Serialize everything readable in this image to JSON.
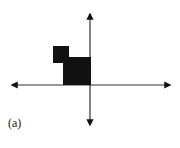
{
  "figure": {
    "label": "(a)",
    "ink_color": "#111111",
    "axes": {
      "origin": [
        90,
        85
      ],
      "x_axis": {
        "from": [
          10,
          85
        ],
        "to": [
          172,
          85
        ],
        "arrows": "both"
      },
      "y_axis": {
        "from": [
          90,
          12
        ],
        "to": [
          90,
          127
        ],
        "arrows": "both"
      }
    },
    "shapes": [
      {
        "name": "small-square",
        "x": 53,
        "y": 46,
        "width": 16,
        "height": 17,
        "fill": "#111111"
      },
      {
        "name": "large-square",
        "x": 63,
        "y": 57,
        "width": 28,
        "height": 28,
        "fill": "#111111"
      }
    ]
  }
}
